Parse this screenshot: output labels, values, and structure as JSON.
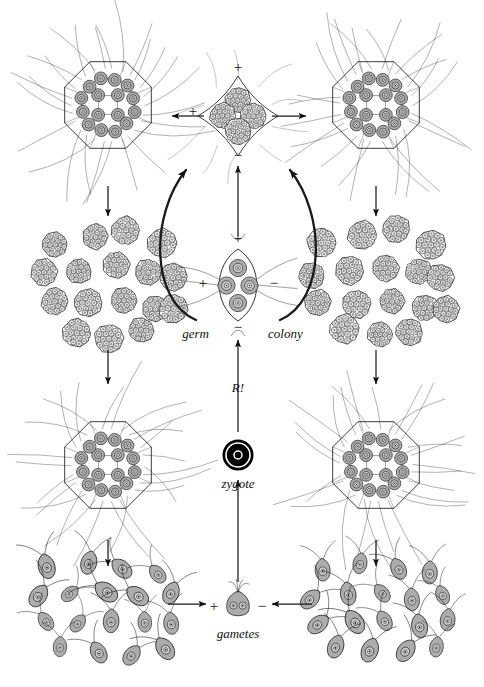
{
  "figure": {
    "background_color": "#ffffff",
    "ink_color": "#1a1a1a",
    "cell_fill_color": "#a8a8a8",
    "colony_fill_color": "#ffffff",
    "width": 484,
    "height": 687
  },
  "labels": {
    "germ": "germ",
    "colony": "colony",
    "reduction": "R!",
    "zygote": "zygote",
    "gametes": "gametes"
  },
  "signs": {
    "plus": "+",
    "minus": "−"
  },
  "sign_markers": [
    {
      "name": "tetrad-top-plus",
      "text": "+",
      "x": 238,
      "y": 72
    },
    {
      "name": "tetrad-left-plus",
      "text": "+",
      "x": 193,
      "y": 116
    },
    {
      "name": "tetrad-bottom-minus",
      "text": "−",
      "x": 238,
      "y": 160
    },
    {
      "name": "germ-left-plus",
      "text": "+",
      "x": 203,
      "y": 288
    },
    {
      "name": "germ-right-minus",
      "text": "−",
      "x": 274,
      "y": 288
    },
    {
      "name": "germ-up-plus",
      "text": "+",
      "x": 238,
      "y": 243
    },
    {
      "name": "meiosis-up-minus",
      "text": "−",
      "x": 238,
      "y": 332
    },
    {
      "name": "gamete-left-plus",
      "text": "+",
      "x": 214,
      "y": 611
    },
    {
      "name": "gamete-right-minus",
      "text": "−",
      "x": 262,
      "y": 611
    }
  ],
  "stages": [
    {
      "name": "adult-colony-top-left",
      "type": "coenobium",
      "cells": 16,
      "x": 108,
      "y": 105
    },
    {
      "name": "adult-colony-top-right",
      "type": "coenobium",
      "cells": 16,
      "x": 376,
      "y": 105
    },
    {
      "name": "adult-colony-bottom-left",
      "type": "coenobium",
      "cells": 16,
      "x": 108,
      "y": 465
    },
    {
      "name": "adult-colony-bottom-right",
      "type": "coenobium",
      "cells": 16,
      "x": 376,
      "y": 465
    },
    {
      "name": "daughter-colony-swarm-left",
      "type": "daughter-colonies",
      "count": 16,
      "x": 108,
      "y": 282
    },
    {
      "name": "daughter-colony-swarm-right",
      "type": "daughter-colonies",
      "count": 16,
      "x": 376,
      "y": 282
    },
    {
      "name": "gamete-swarm-left",
      "type": "gametes",
      "count": 18,
      "x": 105,
      "y": 608
    },
    {
      "name": "gamete-swarm-right",
      "type": "gametes",
      "count": 18,
      "x": 378,
      "y": 608
    },
    {
      "name": "zygote",
      "type": "zygote",
      "x": 238,
      "y": 455
    },
    {
      "name": "germ-colony",
      "type": "germ-colony",
      "cells": 4,
      "x": 238,
      "y": 285
    },
    {
      "name": "tetrad-colony",
      "type": "tetrad",
      "cells": 4,
      "x": 238,
      "y": 116
    },
    {
      "name": "fusing-gametes",
      "type": "syngamy",
      "x": 238,
      "y": 604
    }
  ],
  "arrows": [
    {
      "name": "arrow-left-colony-to-daughters",
      "direction": "down"
    },
    {
      "name": "arrow-left-daughters-to-colony",
      "direction": "down"
    },
    {
      "name": "arrow-left-colony-to-gametes",
      "direction": "down"
    },
    {
      "name": "arrow-right-colony-to-daughters",
      "direction": "down"
    },
    {
      "name": "arrow-right-daughters-to-colony",
      "direction": "down"
    },
    {
      "name": "arrow-right-colony-to-gametes",
      "direction": "down"
    },
    {
      "name": "arrow-tetrad-to-left-colony",
      "direction": "left"
    },
    {
      "name": "arrow-tetrad-to-right-colony",
      "direction": "right"
    },
    {
      "name": "arrow-germ-to-tetrad",
      "direction": "up"
    },
    {
      "name": "arrow-germ-curve-left",
      "direction": "up-left"
    },
    {
      "name": "arrow-germ-curve-right",
      "direction": "up-right"
    },
    {
      "name": "arrow-zygote-to-germ",
      "direction": "up"
    },
    {
      "name": "arrow-gametes-to-zygote",
      "direction": "up"
    },
    {
      "name": "arrow-left-swarm-to-gametes",
      "direction": "right"
    },
    {
      "name": "arrow-right-swarm-to-gametes",
      "direction": "left"
    }
  ],
  "caption": {
    "text": ""
  }
}
